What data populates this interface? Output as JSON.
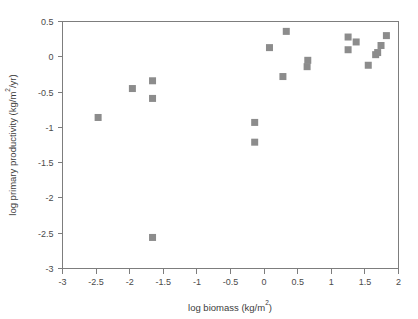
{
  "chart_data": {
    "type": "scatter",
    "title": "",
    "xlabel": "log biomass (kg/m2)",
    "xlabel_base": "log biomass (kg/m",
    "xlabel_exp": "2",
    "xlabel_tail": ")",
    "ylabel": "log primary productivity (kg/m2/yr)",
    "ylabel_base": "log primary productivity (kg/m",
    "ylabel_exp": "2",
    "ylabel_tail": "/yr)",
    "xlim": [
      -3,
      2
    ],
    "ylim": [
      -3,
      0.5
    ],
    "xticks": [
      -3,
      -2.5,
      -2,
      -1.5,
      -1,
      -0.5,
      0,
      0.5,
      1,
      1.5,
      2
    ],
    "xticklabels": [
      "-3",
      "-2.5",
      "-2",
      "-1.5",
      "-1",
      "-0.5",
      "0",
      "0.5",
      "1",
      "1.5",
      "2"
    ],
    "yticks": [
      0.5,
      0,
      -0.5,
      -1,
      -1.5,
      -2,
      -2.5,
      -3
    ],
    "yticklabels": [
      "0.5",
      "0",
      "-0.5",
      "-1",
      "-1.5",
      "-2",
      "-2.5",
      "-3"
    ],
    "grid": false,
    "legend": "none",
    "marker": "square",
    "marker_color": "#8c8c8c",
    "marker_size": 7,
    "points": [
      {
        "x": -2.47,
        "y": -0.86
      },
      {
        "x": -1.96,
        "y": -0.45
      },
      {
        "x": -1.66,
        "y": -0.34
      },
      {
        "x": -1.66,
        "y": -0.59
      },
      {
        "x": -1.66,
        "y": -2.56
      },
      {
        "x": -0.14,
        "y": -0.93
      },
      {
        "x": -0.14,
        "y": -1.21
      },
      {
        "x": 0.08,
        "y": 0.13
      },
      {
        "x": 0.28,
        "y": -0.28
      },
      {
        "x": 0.33,
        "y": 0.36
      },
      {
        "x": 0.65,
        "y": -0.05
      },
      {
        "x": 0.64,
        "y": -0.14
      },
      {
        "x": 1.25,
        "y": 0.28
      },
      {
        "x": 1.25,
        "y": 0.1
      },
      {
        "x": 1.37,
        "y": 0.21
      },
      {
        "x": 1.55,
        "y": -0.12
      },
      {
        "x": 1.66,
        "y": 0.03
      },
      {
        "x": 1.69,
        "y": 0.06
      },
      {
        "x": 1.74,
        "y": 0.16
      },
      {
        "x": 1.82,
        "y": 0.3
      }
    ]
  }
}
